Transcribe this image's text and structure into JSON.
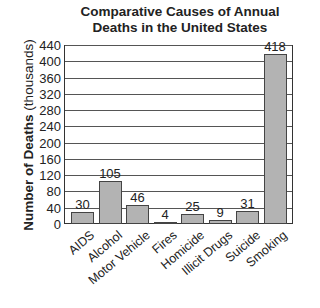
{
  "chart_data": {
    "type": "bar",
    "title": "Comparative Causes of Annual Deaths in the United States",
    "title_lines": [
      "Comparative Causes of Annual",
      "Deaths in the United States"
    ],
    "xlabel": "",
    "ylabel": "Number of Deaths (thousands)",
    "ylabel_bold": "Number of Deaths",
    "ylabel_unit": "(thousands)",
    "categories": [
      "AIDS",
      "Alcohol",
      "Motor Vehicle",
      "Fires",
      "Homicide",
      "Illicit Drugs",
      "Suicide",
      "Smoking"
    ],
    "values": [
      30,
      105,
      46,
      4,
      25,
      9,
      31,
      418
    ],
    "value_labels": [
      "30",
      "105",
      "46",
      "4",
      "25",
      "9",
      "31",
      "418"
    ],
    "ylim": [
      0,
      440
    ],
    "yticks": [
      0,
      40,
      80,
      120,
      160,
      200,
      240,
      280,
      320,
      360,
      400,
      440
    ],
    "ytick_labels": [
      "0",
      "40",
      "80",
      "120",
      "160",
      "200",
      "240",
      "280",
      "320",
      "360",
      "400",
      "440"
    ],
    "grid": true,
    "legend": null,
    "bar_color": "#b3b3b3"
  }
}
